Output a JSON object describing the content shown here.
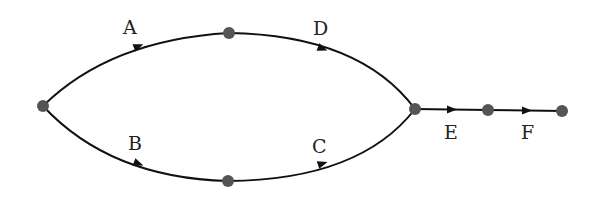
{
  "diagram": {
    "type": "directed-graph",
    "nodes": [
      {
        "id": "start",
        "x": 43,
        "y": 106
      },
      {
        "id": "top",
        "x": 229,
        "y": 33
      },
      {
        "id": "bottom",
        "x": 228,
        "y": 181
      },
      {
        "id": "junction",
        "x": 415,
        "y": 109
      },
      {
        "id": "mid",
        "x": 488,
        "y": 110
      },
      {
        "id": "end",
        "x": 562,
        "y": 111
      }
    ],
    "edges": [
      {
        "label": "A",
        "from": "start",
        "to": "top"
      },
      {
        "label": "D",
        "from": "top",
        "to": "junction"
      },
      {
        "label": "B",
        "from": "start",
        "to": "bottom"
      },
      {
        "label": "C",
        "from": "bottom",
        "to": "junction"
      },
      {
        "label": "E",
        "from": "junction",
        "to": "mid"
      },
      {
        "label": "F",
        "from": "mid",
        "to": "end"
      }
    ],
    "labels": {
      "A": "A",
      "B": "B",
      "C": "C",
      "D": "D",
      "E": "E",
      "F": "F"
    },
    "colors": {
      "edge": "#111111",
      "node": "#555555"
    }
  }
}
